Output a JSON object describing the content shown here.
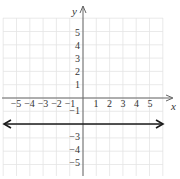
{
  "chart_data": {
    "type": "line",
    "title": "",
    "xlabel": "x",
    "ylabel": "y",
    "xlim": [
      -6,
      6
    ],
    "ylim": [
      -6,
      6
    ],
    "grid": true,
    "x_ticks": [
      "-5",
      "-4",
      "-3",
      "-2",
      "-1",
      "1",
      "2",
      "3",
      "4",
      "5"
    ],
    "y_ticks": [
      "5",
      "4",
      "3",
      "2",
      "1",
      "-1",
      "-3",
      "-4",
      "-5"
    ],
    "series": [
      {
        "name": "y = -2",
        "equation": "y = -2",
        "x": [
          -6,
          6
        ],
        "y": [
          -2,
          -2
        ],
        "arrows": "both"
      }
    ]
  },
  "labels": {
    "x_axis": "x",
    "y_axis": "y",
    "x_neg": [
      "−5",
      "−4",
      "−3",
      "−2",
      "−1"
    ],
    "x_pos": [
      "1",
      "2",
      "3",
      "4",
      "5"
    ],
    "y_pos": [
      "5",
      "4",
      "3",
      "2",
      "1"
    ],
    "y_neg": [
      "−1",
      "−3",
      "−4",
      "−5"
    ]
  },
  "colors": {
    "grid": "#e2e2e2",
    "axis": "#555555",
    "line": "#1a1a1a"
  }
}
